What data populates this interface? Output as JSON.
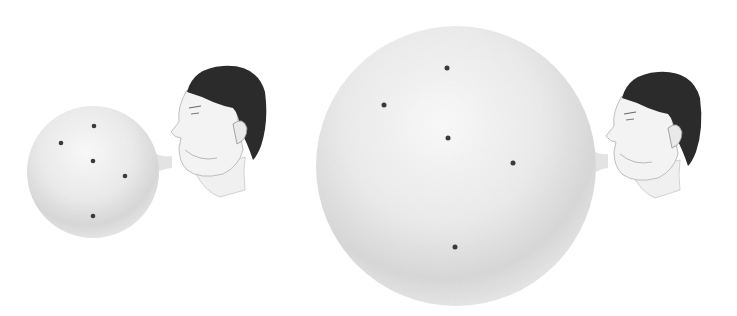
{
  "figure": {
    "description": "Two men blowing up balloons with dots painted on them; the second balloon is larger, so the dots are farther apart",
    "colors": {
      "background": "#ffffff",
      "balloon_light": "#f6f6f6",
      "balloon_shade": "#d4d4d4",
      "dot": "#3a3a3a",
      "hair": "#2b2b2b",
      "skin": "#f2f2f2",
      "skin_line": "#9a9a9a"
    },
    "panels": [
      {
        "name": "small-balloon",
        "balloon": {
          "cx": 93,
          "cy": 172,
          "r": 66
        },
        "dots": [
          [
            94,
            126
          ],
          [
            61,
            143
          ],
          [
            93,
            161
          ],
          [
            125,
            176
          ],
          [
            93,
            216
          ]
        ],
        "neck": {
          "x1": 158,
          "y": 160
        },
        "head": {
          "x": 165,
          "y": 62
        }
      },
      {
        "name": "large-balloon",
        "balloon": {
          "cx": 456,
          "cy": 166,
          "r": 140
        },
        "dots": [
          [
            447,
            68
          ],
          [
            384,
            105
          ],
          [
            448,
            138
          ],
          [
            513,
            163
          ],
          [
            455,
            247
          ]
        ],
        "neck": {
          "x1": 594,
          "y": 160
        },
        "head": {
          "x": 600,
          "y": 70
        }
      }
    ]
  }
}
